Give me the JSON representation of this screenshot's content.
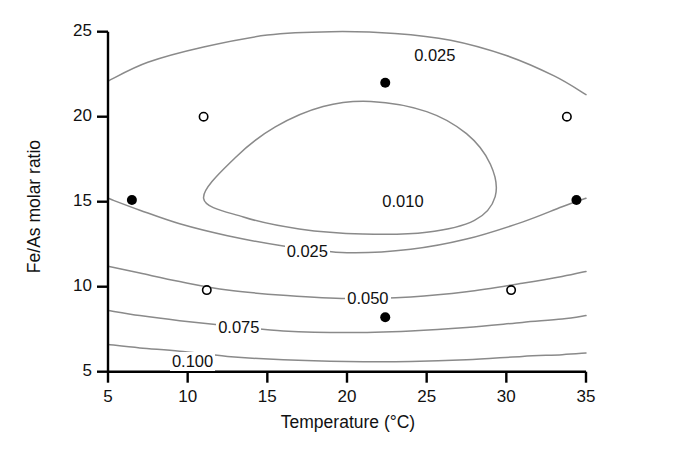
{
  "chart_data": {
    "type": "line",
    "subtype": "contour",
    "title": "",
    "xlabel": "Temperature (°C)",
    "ylabel": "Fe/As molar ratio",
    "xlim": [
      5,
      35
    ],
    "ylim": [
      5,
      25
    ],
    "xticks": [
      5,
      10,
      15,
      20,
      25,
      30,
      35
    ],
    "yticks": [
      5,
      10,
      15,
      20,
      25
    ],
    "xtick_labels": [
      "5",
      "10",
      "15",
      "20",
      "25",
      "30",
      "35"
    ],
    "ytick_labels": [
      "5",
      "10",
      "15",
      "20",
      "25"
    ],
    "grid": false,
    "legend": "none",
    "contour_levels": [
      0.01,
      0.025,
      0.05,
      0.075,
      0.1
    ],
    "contour_labels": [
      "0.010",
      "0.025",
      "0.050",
      "0.075",
      "0.100"
    ],
    "contours": [
      {
        "level": "0.010",
        "label": "0.010",
        "closed": true,
        "label_x": 23.5,
        "label_y": 15.0,
        "points": [
          [
            11.0,
            15.2
          ],
          [
            13.0,
            17.6
          ],
          [
            15.5,
            19.4
          ],
          [
            18.5,
            20.6
          ],
          [
            21.5,
            20.9
          ],
          [
            25.0,
            20.3
          ],
          [
            27.5,
            19.0
          ],
          [
            29.0,
            17.2
          ],
          [
            29.3,
            15.3
          ],
          [
            28.0,
            13.9
          ],
          [
            25.0,
            13.2
          ],
          [
            21.0,
            13.1
          ],
          [
            17.0,
            13.4
          ],
          [
            13.5,
            14.1
          ],
          [
            11.0,
            15.2
          ]
        ]
      },
      {
        "level": "0.025",
        "label": "0.025",
        "branch": "upper",
        "label_x": 25.5,
        "label_y": 23.6,
        "points": [
          [
            5.0,
            22.1
          ],
          [
            7.5,
            23.2
          ],
          [
            11.0,
            24.1
          ],
          [
            15.0,
            24.8
          ],
          [
            19.0,
            25.0
          ],
          [
            23.0,
            24.9
          ],
          [
            26.5,
            24.5
          ],
          [
            30.0,
            23.6
          ],
          [
            33.0,
            22.4
          ],
          [
            35.0,
            21.3
          ]
        ]
      },
      {
        "level": "0.025",
        "label": "0.025",
        "branch": "lower",
        "label_x": 17.5,
        "label_y": 12.1,
        "points": [
          [
            5.0,
            15.2
          ],
          [
            7.0,
            14.5
          ],
          [
            9.5,
            13.7
          ],
          [
            12.5,
            13.0
          ],
          [
            16.0,
            12.4
          ],
          [
            20.0,
            12.0
          ],
          [
            24.0,
            12.2
          ],
          [
            27.5,
            12.8
          ],
          [
            31.0,
            13.8
          ],
          [
            33.5,
            14.7
          ],
          [
            35.0,
            15.2
          ]
        ]
      },
      {
        "level": "0.050",
        "label": "0.050",
        "label_x": 21.3,
        "label_y": 9.3,
        "points": [
          [
            5.0,
            11.2
          ],
          [
            7.0,
            10.8
          ],
          [
            9.5,
            10.3
          ],
          [
            12.5,
            9.8
          ],
          [
            16.0,
            9.5
          ],
          [
            20.0,
            9.3
          ],
          [
            24.0,
            9.4
          ],
          [
            27.5,
            9.7
          ],
          [
            31.0,
            10.2
          ],
          [
            33.5,
            10.6
          ],
          [
            35.0,
            10.9
          ]
        ]
      },
      {
        "level": "0.075",
        "label": "0.075",
        "label_x": 13.2,
        "label_y": 7.6,
        "points": [
          [
            5.0,
            8.6
          ],
          [
            7.0,
            8.3
          ],
          [
            9.5,
            8.0
          ],
          [
            12.5,
            7.7
          ],
          [
            16.0,
            7.4
          ],
          [
            20.0,
            7.3
          ],
          [
            24.0,
            7.4
          ],
          [
            27.5,
            7.6
          ],
          [
            31.0,
            7.9
          ],
          [
            33.5,
            8.1
          ],
          [
            35.0,
            8.3
          ]
        ]
      },
      {
        "level": "0.100",
        "label": "0.100",
        "label_x": 10.3,
        "label_y": 5.6,
        "points": [
          [
            5.0,
            6.6
          ],
          [
            7.0,
            6.4
          ],
          [
            9.5,
            6.2
          ],
          [
            12.5,
            5.9
          ],
          [
            16.0,
            5.7
          ],
          [
            20.0,
            5.6
          ],
          [
            24.0,
            5.6
          ],
          [
            27.5,
            5.7
          ],
          [
            31.0,
            5.9
          ],
          [
            33.5,
            6.0
          ],
          [
            35.0,
            6.1
          ]
        ]
      }
    ],
    "points_filled": [
      [
        6.5,
        15.1
      ],
      [
        22.4,
        22.0
      ],
      [
        22.4,
        15.0
      ],
      [
        22.4,
        8.2
      ],
      [
        34.4,
        15.1
      ]
    ],
    "points_open": [
      [
        11.0,
        20.0
      ],
      [
        11.2,
        9.8
      ],
      [
        33.8,
        20.0
      ],
      [
        30.3,
        9.8
      ]
    ]
  }
}
